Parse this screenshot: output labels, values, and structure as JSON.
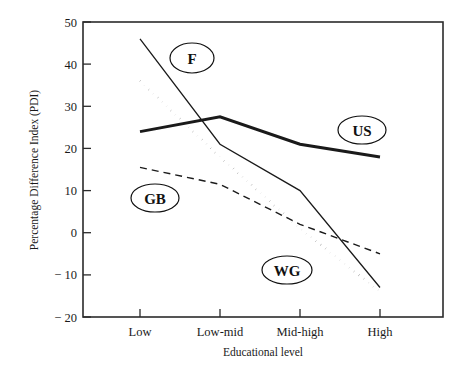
{
  "chart_data": {
    "type": "line",
    "title": "",
    "xlabel": "Educational level",
    "ylabel": "Percentage Difference Index (PDI)",
    "categories": [
      "Low",
      "Low-mid",
      "Mid-high",
      "High"
    ],
    "xticklabels": [
      "Low",
      "Low-mid",
      "Mid-high",
      "High"
    ],
    "yticklabels": [
      "50",
      "40",
      "30",
      "20",
      "10",
      "0",
      "− 10",
      "− 20"
    ],
    "ytickvalues": [
      50,
      40,
      30,
      20,
      10,
      0,
      -10,
      -20
    ],
    "ylim": [
      -20,
      50
    ],
    "xlim": [
      0,
      3
    ],
    "grid": false,
    "legend_position": "inline-annotations",
    "series": [
      {
        "name": "F",
        "label": "F",
        "style": "solid-thin",
        "color": "#1a1a1a",
        "values": [
          46,
          21,
          10,
          -13
        ]
      },
      {
        "name": "US",
        "label": "US",
        "style": "solid-thick",
        "color": "#1a1a1a",
        "values": [
          24,
          27.5,
          21,
          18
        ]
      },
      {
        "name": "GB",
        "label": "GB",
        "style": "dashed",
        "color": "#1a1a1a",
        "values": [
          15.5,
          11.5,
          2,
          -5
        ]
      },
      {
        "name": "WG",
        "label": "WG",
        "style": "dotted",
        "color": "#1a1a1a",
        "values": [
          36,
          18,
          1,
          -14
        ]
      }
    ],
    "annotations": [
      {
        "text": "F",
        "series": "F",
        "x_px": 192,
        "y_px": 58
      },
      {
        "text": "US",
        "series": "US",
        "x_px": 362,
        "y_px": 130
      },
      {
        "text": "GB",
        "series": "GB",
        "x_px": 155,
        "y_px": 198
      },
      {
        "text": "WG",
        "series": "WG",
        "x_px": 287,
        "y_px": 270
      }
    ]
  },
  "axes": {
    "y_title": "Percentage Difference Index (PDI)",
    "x_title": "Educational level"
  }
}
